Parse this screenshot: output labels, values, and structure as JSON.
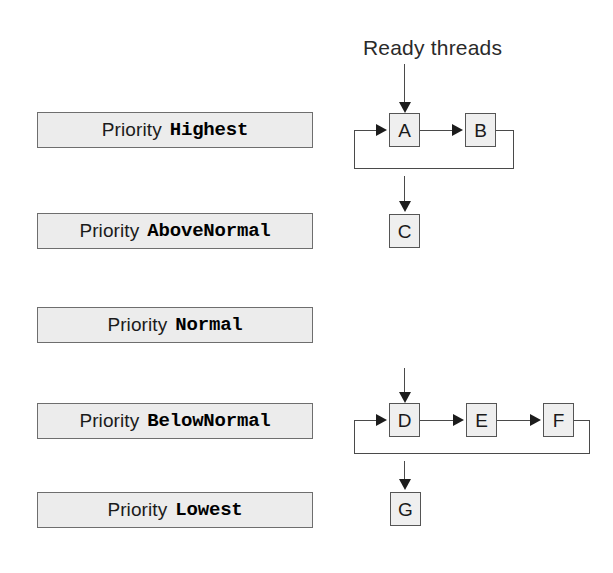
{
  "diagram": {
    "title": "Ready threads",
    "caption_label": "Ready threads",
    "colors": {
      "plate_fill": "#ececec",
      "plate_border": "#6e6e6e",
      "node_fill": "#efefef",
      "node_border": "#555555",
      "line": "#4a4a4a",
      "arrow": "#1c1c1c",
      "text": "#1a1a1a",
      "background": "#ffffff"
    },
    "priority_prefix": "Priority",
    "levels": [
      {
        "id": "highest",
        "prefix": "Priority",
        "value": "Highest",
        "threads": [
          "A",
          "B"
        ],
        "has_feedback_loop": true,
        "has_incoming_arrow": true
      },
      {
        "id": "abovenormal",
        "prefix": "Priority",
        "value": "AboveNormal",
        "threads": [
          "C"
        ],
        "has_feedback_loop": false,
        "has_incoming_arrow": true
      },
      {
        "id": "normal",
        "prefix": "Priority",
        "value": "Normal",
        "threads": [],
        "has_feedback_loop": false,
        "has_incoming_arrow": false
      },
      {
        "id": "belownormal",
        "prefix": "Priority",
        "value": "BelowNormal",
        "threads": [
          "D",
          "E",
          "F"
        ],
        "has_feedback_loop": true,
        "has_incoming_arrow": true
      },
      {
        "id": "lowest",
        "prefix": "Priority",
        "value": "Lowest",
        "threads": [
          "G"
        ],
        "has_feedback_loop": false,
        "has_incoming_arrow": true
      }
    ],
    "nodes": {
      "a": "A",
      "b": "B",
      "c": "C",
      "d": "D",
      "e": "E",
      "f": "F",
      "g": "G"
    }
  }
}
